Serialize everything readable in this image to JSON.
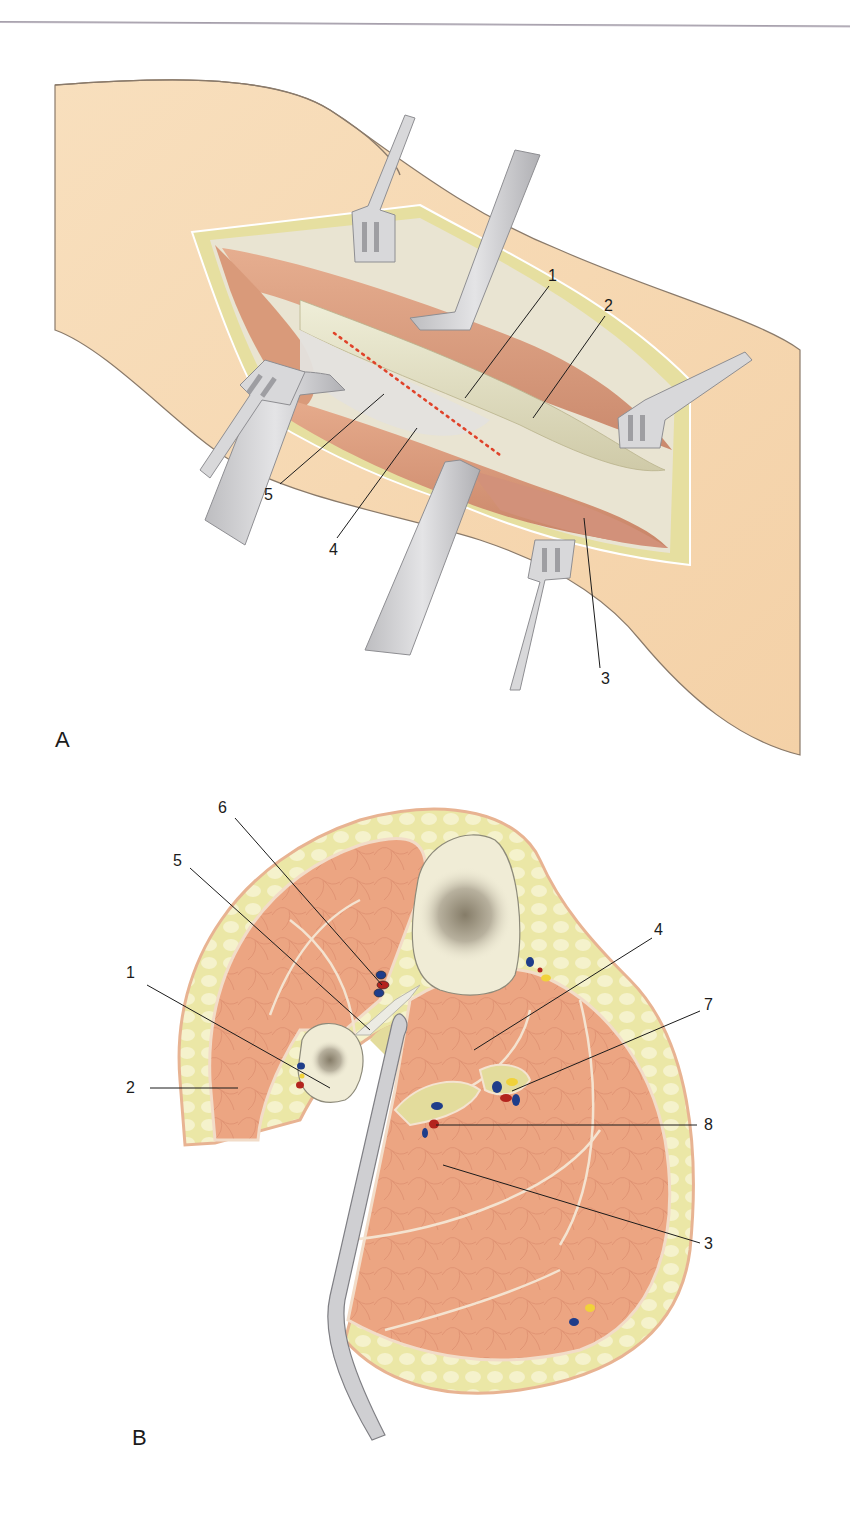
{
  "figure": {
    "panels": [
      {
        "id": "A",
        "letter": "A",
        "description": "Surgical exposure with retractors",
        "callouts": [
          {
            "num": "1",
            "x": 553,
            "y": 276
          },
          {
            "num": "2",
            "x": 608,
            "y": 306
          },
          {
            "num": "3",
            "x": 605,
            "y": 677
          },
          {
            "num": "4",
            "x": 333,
            "y": 549
          },
          {
            "num": "5",
            "x": 268,
            "y": 494
          }
        ],
        "incision_marker": "red dotted line"
      },
      {
        "id": "B",
        "letter": "B",
        "description": "Cross-section with retractor",
        "callouts": [
          {
            "num": "1",
            "x": 128,
            "y": 974
          },
          {
            "num": "2",
            "x": 128,
            "y": 1081
          },
          {
            "num": "3",
            "x": 706,
            "y": 1245
          },
          {
            "num": "4",
            "x": 655,
            "y": 930
          },
          {
            "num": "5",
            "x": 176,
            "y": 862
          },
          {
            "num": "6",
            "x": 222,
            "y": 811
          },
          {
            "num": "7",
            "x": 706,
            "y": 1004
          },
          {
            "num": "8",
            "x": 706,
            "y": 1125
          }
        ]
      }
    ],
    "colors": {
      "skin": "#f6d6ad",
      "skin_edge": "#8a7a6a",
      "fat": "#e9e6a8",
      "fat_light": "#f3f0c8",
      "muscle": "#e8a37f",
      "muscle_dark": "#c98a6d",
      "fascia": "#ecdcc4",
      "tendon": "#e6e2c4",
      "bone": "#f0ecd6",
      "marrow": "#8a8270",
      "retractor": "#d4d4d6",
      "retractor_edge": "#8e8e92",
      "artery": "#b3241e",
      "vein": "#1f3d8a",
      "nerve": "#f0d23a",
      "incision_dots": "#e0432a",
      "leader_line": "#1b1b1b"
    }
  }
}
